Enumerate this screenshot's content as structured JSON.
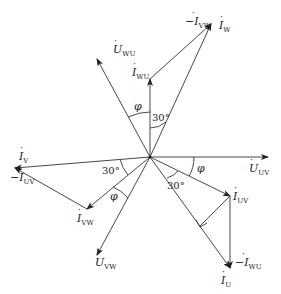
{
  "diagram": {
    "type": "phasor-diagram",
    "origin": {
      "x": 150,
      "y": 157
    },
    "colors": {
      "line": "#333333",
      "text": "#222222",
      "background": "#ffffff"
    },
    "voltages": [
      {
        "name": "U_UV",
        "label": "U",
        "sub": "UV",
        "dot": true,
        "neg": false,
        "end": {
          "x": 268,
          "y": 157
        }
      },
      {
        "name": "U_WU",
        "label": "U",
        "sub": "WU",
        "dot": true,
        "neg": false,
        "end": {
          "x": 96,
          "y": 58
        }
      },
      {
        "name": "U_VW",
        "label": "U",
        "sub": "VW",
        "dot": true,
        "neg": false,
        "end": {
          "x": 96,
          "y": 256
        }
      }
    ],
    "currents": [
      {
        "name": "I_WU",
        "label": "I",
        "sub": "WU",
        "dot": true,
        "neg": false
      },
      {
        "name": "I_W",
        "label": "I",
        "sub": "W",
        "dot": true,
        "neg": false
      },
      {
        "name": "neg_I_VW",
        "label": "I",
        "sub": "VW",
        "dot": true,
        "neg": true
      },
      {
        "name": "I_V",
        "label": "I",
        "sub": "V",
        "dot": true,
        "neg": false
      },
      {
        "name": "I_VW",
        "label": "I",
        "sub": "VW",
        "dot": true,
        "neg": false
      },
      {
        "name": "neg_I_UV",
        "label": "I",
        "sub": "UV",
        "dot": true,
        "neg": true
      },
      {
        "name": "I_UV",
        "label": "I",
        "sub": "UV",
        "dot": true,
        "neg": false
      },
      {
        "name": "I_U",
        "label": "I",
        "sub": "U",
        "dot": true,
        "neg": false
      },
      {
        "name": "neg_I_WU",
        "label": "I",
        "sub": "WU",
        "dot": true,
        "neg": true
      }
    ],
    "angles": [
      {
        "name": "phi-top",
        "text": "φ"
      },
      {
        "name": "30deg-top",
        "text": "30°"
      },
      {
        "name": "phi-right",
        "text": "φ"
      },
      {
        "name": "30deg-right",
        "text": "30°"
      },
      {
        "name": "30deg-left",
        "text": "30°"
      },
      {
        "name": "phi-left",
        "text": "φ"
      }
    ],
    "labels": {
      "U_WU": {
        "main": "U",
        "sub": "WU",
        "prefix": ""
      },
      "U_UV": {
        "main": "U",
        "sub": "UV",
        "prefix": ""
      },
      "U_VW": {
        "main": "U",
        "sub": "VW",
        "prefix": ""
      },
      "I_WU": {
        "main": "I",
        "sub": "WU",
        "prefix": ""
      },
      "I_W": {
        "main": "I",
        "sub": "W",
        "prefix": ""
      },
      "neg_I_VW": {
        "main": "I",
        "sub": "VW",
        "prefix": "−"
      },
      "I_V": {
        "main": "I",
        "sub": "V",
        "prefix": ""
      },
      "neg_I_UV": {
        "main": "I",
        "sub": "UV",
        "prefix": "−"
      },
      "I_VW": {
        "main": "I",
        "sub": "VW",
        "prefix": ""
      },
      "I_UV": {
        "main": "I",
        "sub": "UV",
        "prefix": ""
      },
      "I_U": {
        "main": "I",
        "sub": "U",
        "prefix": ""
      },
      "neg_I_WU": {
        "main": "I",
        "sub": "WU",
        "prefix": "−"
      }
    }
  }
}
